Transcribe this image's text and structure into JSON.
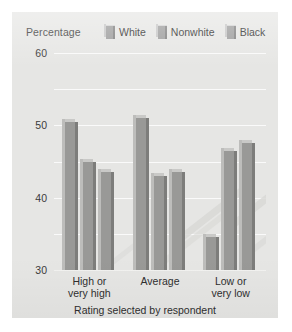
{
  "chart_data": {
    "type": "bar",
    "title": "",
    "xlabel": "Rating selected by respondent",
    "ylabel": "Percentage",
    "categories": [
      "High or\nvery high",
      "Average",
      "Low or\nvery low"
    ],
    "category_lines": [
      [
        "High or",
        "very high"
      ],
      [
        "Average",
        ""
      ],
      [
        "Low or",
        "very low"
      ]
    ],
    "series": [
      {
        "name": "White",
        "values": [
          41,
          42,
          9
        ]
      },
      {
        "name": "Nonwhite",
        "values": [
          30,
          26,
          33
        ]
      },
      {
        "name": "Black",
        "values": [
          27,
          27,
          35
        ]
      }
    ],
    "ylim": [
      0,
      60
    ],
    "yticks": [
      0,
      10,
      20,
      30,
      40,
      50,
      60
    ],
    "ytick_labels": [
      "0",
      "10",
      "20",
      "30",
      "40",
      "50",
      "60"
    ],
    "grid": true,
    "legend_position": "top-right",
    "colors": {
      "bar_face": "#999997",
      "bar_shadow": "#7d7d7b",
      "bar_top": "#c9c9c7",
      "panel": "#e6e6e4",
      "gridline": "#fafafa",
      "text": "#2f2f2f"
    }
  }
}
